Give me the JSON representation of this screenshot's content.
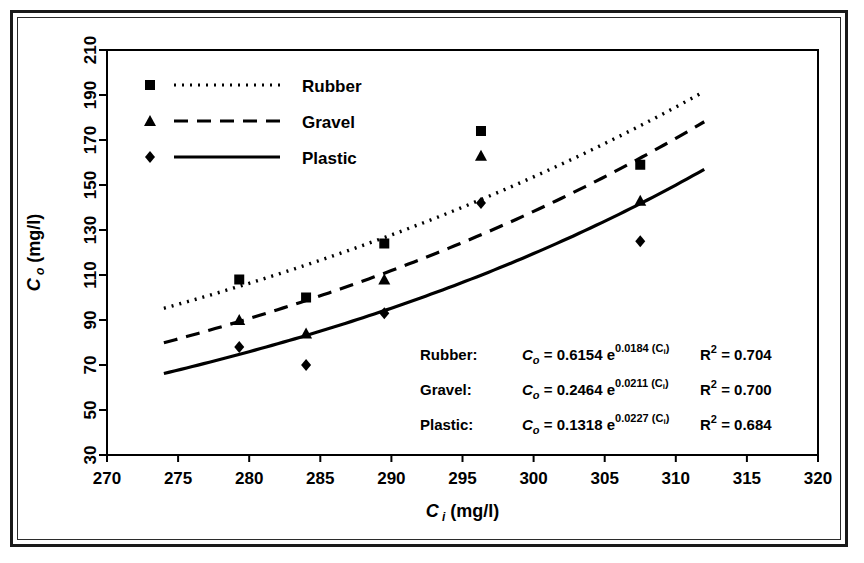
{
  "figure": {
    "frame_color": "#1a1a1a",
    "background": "#ffffff"
  },
  "chart_data": {
    "type": "scatter",
    "title": "",
    "xlabel": "C i (mg/l)",
    "ylabel": "C o (mg/l)",
    "xlim": [
      270,
      320
    ],
    "ylim": [
      30,
      210
    ],
    "xticks": [
      270,
      275,
      280,
      285,
      290,
      295,
      300,
      305,
      310,
      315,
      320
    ],
    "yticks": [
      30,
      50,
      70,
      90,
      110,
      130,
      150,
      170,
      190,
      210
    ],
    "grid": false,
    "legend_position": "top-left inside axes",
    "series": [
      {
        "name": "Rubber",
        "marker": "square",
        "line_style": "dotted",
        "color": "#000000",
        "x": [
          279.3,
          284.0,
          289.5,
          296.3,
          307.5
        ],
        "y": [
          108,
          100,
          124,
          174,
          159
        ],
        "fit_label": "Rubber:",
        "fit_coefficient": "0.6154",
        "fit_exponent": "0.0184",
        "r_squared": "0.704",
        "curve_x_start": 274,
        "curve_x_end": 312
      },
      {
        "name": "Gravel",
        "marker": "triangle",
        "line_style": "dashed",
        "color": "#000000",
        "x": [
          279.3,
          284.0,
          289.5,
          296.3,
          307.5
        ],
        "y": [
          90,
          84,
          108,
          163,
          143
        ],
        "fit_label": "Gravel:",
        "fit_coefficient": "0.2464",
        "fit_exponent": "0.0211",
        "r_squared": "0.700",
        "curve_x_start": 274,
        "curve_x_end": 312
      },
      {
        "name": "Plastic",
        "marker": "diamond",
        "line_style": "solid",
        "color": "#000000",
        "x": [
          279.3,
          284.0,
          289.5,
          296.3,
          307.5
        ],
        "y": [
          78,
          70,
          93,
          142,
          125
        ],
        "fit_label": "Plastic:",
        "fit_coefficient": "0.1318",
        "fit_exponent": "0.0227",
        "r_squared": "0.684",
        "curve_x_start": 274,
        "curve_x_end": 312
      }
    ]
  },
  "axes": {
    "x_title_var": "C",
    "x_title_sub": "i",
    "x_title_unit": "(mg/l)",
    "y_title_var": "C",
    "y_title_sub": "o",
    "y_title_unit": "(mg/l)"
  },
  "legend": {
    "items": [
      {
        "label": "Rubber"
      },
      {
        "label": "Gravel"
      },
      {
        "label": "Plastic"
      }
    ]
  },
  "equations": {
    "lhs_var": "C",
    "lhs_sub": "o",
    "equals": "=",
    "exp_base": "e",
    "exp_arg_open": "(",
    "exp_arg_var": "C",
    "exp_arg_sub": "i",
    "exp_arg_close": ")",
    "r_label": "R",
    "r_exponent": "2",
    "rows": [
      {
        "name": "Rubber:",
        "coefficient": "0.6154",
        "exponent": "0.0184",
        "r_squared": "0.704"
      },
      {
        "name": "Gravel:",
        "coefficient": "0.2464",
        "exponent": "0.0211",
        "r_squared": "0.700"
      },
      {
        "name": "Plastic:",
        "coefficient": "0.1318",
        "exponent": "0.0227",
        "r_squared": "0.684"
      }
    ]
  }
}
